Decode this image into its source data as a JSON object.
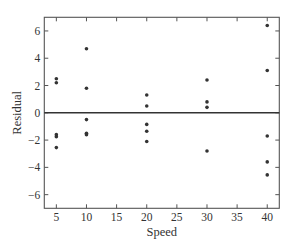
{
  "chart_data": {
    "type": "scatter",
    "title": "",
    "xlabel": "Speed",
    "ylabel": "Residual",
    "xlim": [
      3,
      42
    ],
    "ylim": [
      -7,
      7
    ],
    "xticks": [
      5,
      10,
      15,
      20,
      25,
      30,
      35,
      40
    ],
    "yticks": [
      -6,
      -4,
      -2,
      0,
      2,
      4,
      6
    ],
    "xtick_labels": [
      "5",
      "10",
      "15",
      "20",
      "25",
      "30",
      "35",
      "40"
    ],
    "ytick_labels": [
      "−6",
      "−4",
      "−2",
      "0",
      "2",
      "4",
      "6"
    ],
    "grid": false,
    "legend": null,
    "reference_line": {
      "y": 0,
      "color": "#333333"
    },
    "series": [
      {
        "name": "Residuals",
        "color": "#333333",
        "points": [
          {
            "x": 5,
            "y": 2.5
          },
          {
            "x": 5,
            "y": 2.2
          },
          {
            "x": 5,
            "y": -1.6
          },
          {
            "x": 5,
            "y": -1.75
          },
          {
            "x": 5,
            "y": -2.55
          },
          {
            "x": 10,
            "y": 4.7
          },
          {
            "x": 10,
            "y": 1.8
          },
          {
            "x": 10,
            "y": -0.5
          },
          {
            "x": 10,
            "y": -1.5
          },
          {
            "x": 10,
            "y": -1.6
          },
          {
            "x": 20,
            "y": 1.3
          },
          {
            "x": 20,
            "y": 0.5
          },
          {
            "x": 20,
            "y": -0.85
          },
          {
            "x": 20,
            "y": -1.35
          },
          {
            "x": 20,
            "y": -2.1
          },
          {
            "x": 30,
            "y": 2.4
          },
          {
            "x": 30,
            "y": 0.8
          },
          {
            "x": 30,
            "y": 0.4
          },
          {
            "x": 30,
            "y": -2.8
          },
          {
            "x": 40,
            "y": 6.4
          },
          {
            "x": 40,
            "y": 3.1
          },
          {
            "x": 40,
            "y": -1.7
          },
          {
            "x": 40,
            "y": -3.6
          },
          {
            "x": 40,
            "y": -4.55
          }
        ]
      }
    ]
  },
  "layout": {
    "plot_left": 44.3,
    "plot_right": 279.3,
    "plot_top": 17.3,
    "plot_bottom": 208.3
  }
}
